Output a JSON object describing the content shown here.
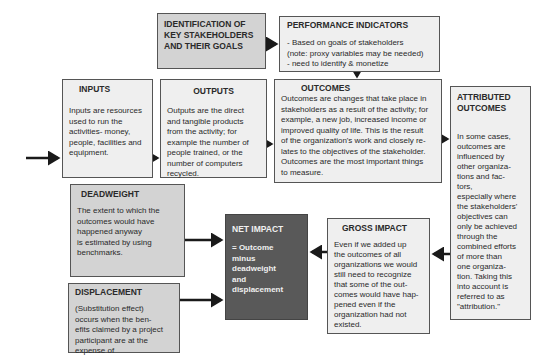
{
  "diagram": {
    "identification": {
      "title": "IDENTIFICATION OF\nKEY STAKEHOLDERS\nAND THEIR GOALS"
    },
    "performance_indicators": {
      "title": "PERFORMANCE INDICATORS",
      "body": "- Based on goals of stakeholders\n(note: proxy variables may be needed)\n- need to identify & monetize"
    },
    "inputs": {
      "title": "INPUTS",
      "body": "Inputs are resources\nused to run the\nactivities- money,\npeople, facilities and\nequipment."
    },
    "outputs": {
      "title": "OUTPUTS",
      "body": "Outputs are the direct\nand tangible products\nfrom the activity; for\nexample the number of\npeople trained, or the\nnumber of computers\nrecycled."
    },
    "outcomes": {
      "title": "OUTCOMES",
      "body": "Outcomes are changes that take place in\nstakeholders as a result of the activity; for\nexample, a new job, increased income or\nimproved quality of life. This is the result\nof the organization's work and closely re-\nlates to the objectives of the stakeholder.\nOutcomes are the most important things\nto measure."
    },
    "attributed_outcomes": {
      "title": "ATTRIBUTED\nOUTCOMES",
      "body": "In some cases,\noutcomes are\ninfluenced by\nother organiza-\ntions and fac-\ntors,\nespecially where\nthe stakeholders'\nobjectives can\nonly be achieved\nthrough the\ncombined efforts\nof more than\none organiza-\ntion. Taking this\ninto account is\nreferred to as\n\"attribution.\""
    },
    "deadweight": {
      "title": "DEADWEIGHT",
      "body": "The extent to which the\noutcomes would have\nhappened anyway\nis estimated by using\nbenchmarks."
    },
    "displacement": {
      "title": "DISPLACEMENT",
      "body": "(Substitution effect)\noccurs when the ben-\nefits claimed by a project\nparticipant are at the\nexpense of"
    },
    "net_impact": {
      "title": "NET IMPACT",
      "body": "= Outcome\nminus\ndeadweight\nand\ndisplacement"
    },
    "gross_impact": {
      "title": "GROSS IMPACT",
      "body": "Even if we added up\nthe outcomes of all\norganizations we would\nstill need to recognize\nthat some of the out-\ncomes would have hap-\npened even if the\norganization had not\nexisted."
    }
  },
  "colors": {
    "box_fill": "#efefef",
    "highlight_fill": "#d3d3d3",
    "net_impact_fill": "#595959",
    "border": "#555555",
    "arrow": "#1a1a1a"
  }
}
